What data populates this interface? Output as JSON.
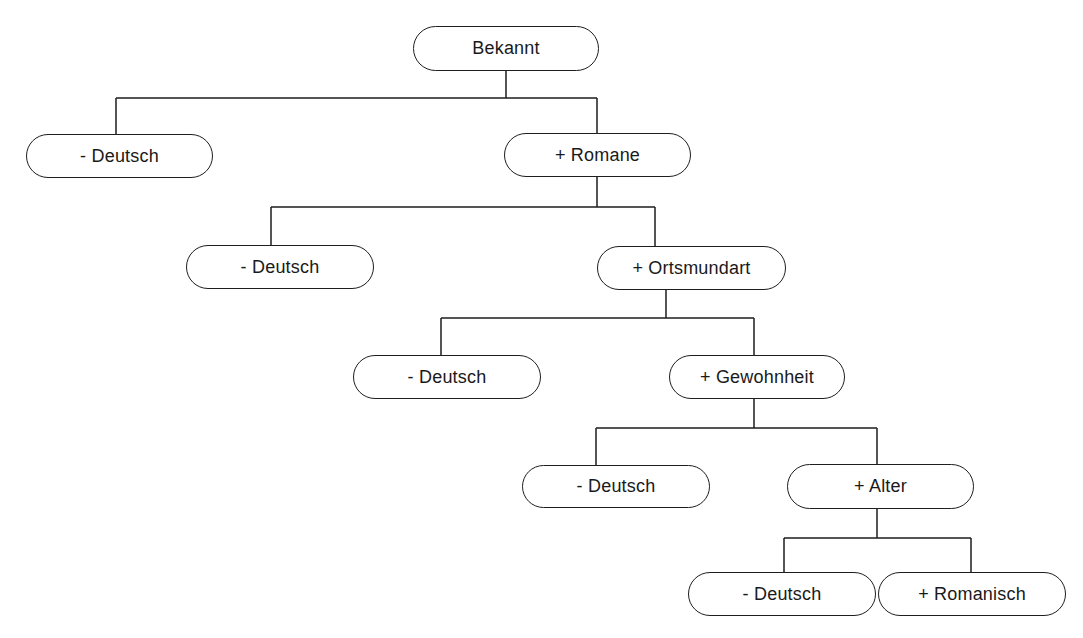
{
  "diagram": {
    "type": "decision-tree",
    "colors": {
      "line": "#1e1e1e",
      "text": "#1a1a1a",
      "background": "#ffffff"
    },
    "nodes": [
      {
        "id": "bekannt",
        "label": "Bekannt",
        "x": 413,
        "y": 26,
        "w": 186,
        "h": 45
      },
      {
        "id": "deutsch-1",
        "label": "- Deutsch",
        "x": 26,
        "y": 134,
        "w": 187,
        "h": 44
      },
      {
        "id": "romane",
        "label": "+ Romane",
        "x": 504,
        "y": 133,
        "w": 187,
        "h": 44
      },
      {
        "id": "deutsch-2",
        "label": "- Deutsch",
        "x": 186,
        "y": 245,
        "w": 188,
        "h": 44
      },
      {
        "id": "ortsmundart",
        "label": "+ Ortsmundart",
        "x": 597,
        "y": 246,
        "w": 189,
        "h": 44
      },
      {
        "id": "deutsch-3",
        "label": "- Deutsch",
        "x": 353,
        "y": 355,
        "w": 188,
        "h": 44
      },
      {
        "id": "gewohnheit",
        "label": "+ Gewohnheit",
        "x": 669,
        "y": 355,
        "w": 176,
        "h": 44
      },
      {
        "id": "deutsch-4",
        "label": "- Deutsch",
        "x": 522,
        "y": 465,
        "w": 188,
        "h": 43
      },
      {
        "id": "alter",
        "label": "+ Alter",
        "x": 787,
        "y": 464,
        "w": 187,
        "h": 45
      },
      {
        "id": "deutsch-5",
        "label": "- Deutsch",
        "x": 688,
        "y": 572,
        "w": 188,
        "h": 44
      },
      {
        "id": "romanisch",
        "label": "+ Romanisch",
        "x": 878,
        "y": 572,
        "w": 188,
        "h": 44
      }
    ],
    "edges": [
      {
        "parent": "bekannt",
        "children": [
          "deutsch-1",
          "romane"
        ],
        "path": "M506 71 V98 M116 98 H597 M116 98 V134 M597 98 V133"
      },
      {
        "parent": "romane",
        "children": [
          "deutsch-2",
          "ortsmundart"
        ],
        "path": "M597 177 V207 M271 207 H655 M271 207 V245 M655 207 V246"
      },
      {
        "parent": "ortsmundart",
        "children": [
          "deutsch-3",
          "gewohnheit"
        ],
        "path": "M666 290 V318 M441 318 H754 M441 318 V355 M754 318 V355"
      },
      {
        "parent": "gewohnheit",
        "children": [
          "deutsch-4",
          "alter"
        ],
        "path": "M754 399 V428 M596 428 H877 M596 428 V465 M877 428 V464"
      },
      {
        "parent": "alter",
        "children": [
          "deutsch-5",
          "romanisch"
        ],
        "path": "M877 509 V538 M784 538 H971 M784 538 V572 M971 538 V572"
      }
    ]
  }
}
